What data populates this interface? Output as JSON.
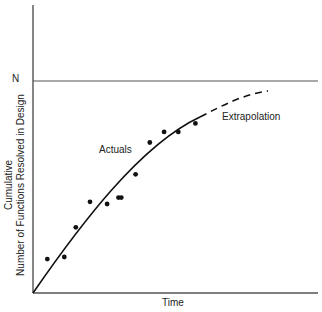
{
  "chart_data": {
    "type": "scatter",
    "title": "",
    "xlabel": "Time",
    "ylabel_line1": "Cumulative",
    "ylabel_line2": "Number of Functions Resolved in Design",
    "y_reference": {
      "label": "N",
      "value": 1.0
    },
    "grid": false,
    "legend": "none",
    "annotations": [
      "Actuals",
      "Extrapolation"
    ],
    "xlim": [
      0,
      1
    ],
    "ylim": [
      0,
      1.35
    ],
    "series": [
      {
        "name": "Actuals",
        "kind": "points",
        "x": [
          0.05,
          0.11,
          0.15,
          0.2,
          0.26,
          0.3,
          0.31,
          0.36,
          0.41,
          0.46,
          0.51,
          0.57
        ],
        "y": [
          0.16,
          0.17,
          0.31,
          0.43,
          0.42,
          0.45,
          0.45,
          0.56,
          0.71,
          0.76,
          0.76,
          0.8
        ]
      },
      {
        "name": "Fitted curve (solid)",
        "kind": "line",
        "x": [
          0.0,
          0.1,
          0.2,
          0.3,
          0.4,
          0.5,
          0.59
        ],
        "y": [
          0.0,
          0.2,
          0.38,
          0.53,
          0.66,
          0.76,
          0.83
        ]
      },
      {
        "name": "Extrapolation (dashed)",
        "kind": "line",
        "x": [
          0.59,
          0.68,
          0.78,
          0.83
        ],
        "y": [
          0.83,
          0.9,
          0.94,
          0.95
        ]
      }
    ]
  },
  "labels": {
    "n": "N",
    "actuals": "Actuals",
    "extrapolation": "Extrapolation",
    "x_axis": "Time",
    "y_axis_line1": "Cumulative",
    "y_axis_line2": "Number of Functions Resolved in Design"
  },
  "colors": {
    "ink": "#222222",
    "axis": "#555555",
    "background": "#ffffff"
  }
}
